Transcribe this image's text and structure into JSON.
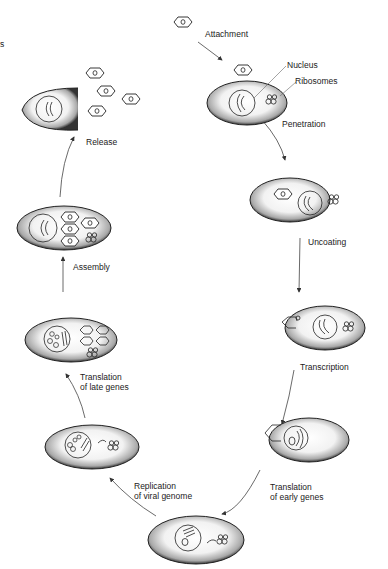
{
  "diagram": {
    "type": "viral replication cycle",
    "colors": {
      "ink": "#1a1a1a",
      "cell_fill": "#f4f4f4",
      "cell_shade": "#9a9a9a",
      "background": "#ffffff"
    },
    "edge_label": "s",
    "labels": {
      "attachment": "Attachment",
      "nucleus": "Nucleus",
      "ribosomes": "Ribosomes",
      "penetration": "Penetration",
      "uncoating": "Uncoating",
      "transcription": "Transcription",
      "translation_early": "Translation\nof early genes",
      "replication": "Replication\nof viral genome",
      "translation_late": "Translation\nof late genes",
      "assembly": "Assembly",
      "release": "Release"
    },
    "stages": [
      {
        "id": "attachment",
        "order": 1
      },
      {
        "id": "penetration",
        "order": 2
      },
      {
        "id": "uncoating",
        "order": 3
      },
      {
        "id": "transcription",
        "order": 4
      },
      {
        "id": "translation_early",
        "order": 5
      },
      {
        "id": "replication",
        "order": 6
      },
      {
        "id": "translation_late",
        "order": 7
      },
      {
        "id": "assembly",
        "order": 8
      },
      {
        "id": "release",
        "order": 9
      }
    ]
  }
}
